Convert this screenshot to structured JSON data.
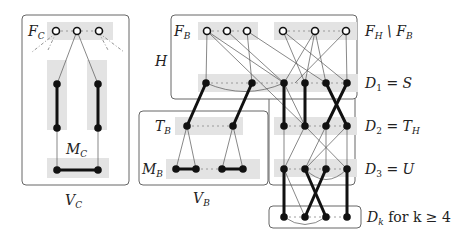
{
  "diagram": {
    "type": "graph-structure",
    "labels": {
      "fc": "F",
      "fc_sub": "C",
      "mc": "M",
      "mc_sub": "C",
      "vc": "V",
      "vc_sub": "C",
      "fb": "F",
      "fb_sub": "B",
      "h": "H",
      "fh_minus_fb": "F",
      "fh_minus_fb_sub": "H",
      "fh_minus_fb_tail": " \\ F",
      "fh_minus_fb_tail_sub": "B",
      "d1": "D",
      "d1_sub": "1",
      "d1_eq": " = S",
      "tb": "T",
      "tb_sub": "B",
      "d2": "D",
      "d2_sub": "2",
      "d2_eq": " = T",
      "d2_eq_sub": "H",
      "mb": "M",
      "mb_sub": "B",
      "d3": "D",
      "d3_sub": "3",
      "d3_eq": " = U",
      "vb": "V",
      "vb_sub": "B",
      "dk": "D",
      "dk_sub": "k",
      "dk_tail": " for k ≥ 4"
    },
    "colors": {
      "band": "#e3e3e3",
      "edge": "#111111",
      "thin_edge": "#555555",
      "box": "#666666"
    }
  }
}
